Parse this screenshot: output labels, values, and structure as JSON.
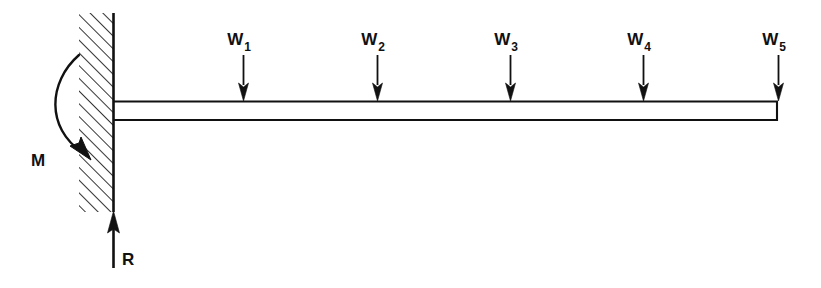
{
  "figure": {
    "type": "free-body-diagram",
    "width": 821,
    "height": 288,
    "background_color": "#ffffff",
    "line_color": "#111111"
  },
  "wall": {
    "name": "fixed-support-wall",
    "hatch_direction": "lower-left-to-upper-right",
    "x": 79,
    "y": 13,
    "width": 34,
    "height": 199,
    "face_line_x": 113
  },
  "beam": {
    "name": "cantilever-beam",
    "x_start": 113,
    "x_end": 778,
    "y_top": 101,
    "y_bottom": 120
  },
  "moment": {
    "label": "M",
    "label_x": 38,
    "label_y": 166,
    "direction": "clockwise-into-wall",
    "arc_start": [
      79,
      55
    ],
    "arc_end": [
      88,
      156
    ]
  },
  "reaction": {
    "label": "R",
    "label_x": 122,
    "label_y": 265,
    "direction": "up",
    "x": 113,
    "y_tail": 268,
    "y_tip": 212
  },
  "loads": [
    {
      "label": "W",
      "subscript": "1",
      "x": 243,
      "label_y": 45,
      "shaft_top": 55,
      "tip_y": 101,
      "direction": "down"
    },
    {
      "label": "W",
      "subscript": "2",
      "x": 377,
      "label_y": 45,
      "shaft_top": 55,
      "tip_y": 101,
      "direction": "down"
    },
    {
      "label": "W",
      "subscript": "3",
      "x": 510,
      "label_y": 45,
      "shaft_top": 55,
      "tip_y": 101,
      "direction": "down"
    },
    {
      "label": "W",
      "subscript": "4",
      "x": 643,
      "label_y": 45,
      "shaft_top": 55,
      "tip_y": 101,
      "direction": "down"
    },
    {
      "label": "W",
      "subscript": "5",
      "x": 778,
      "label_y": 45,
      "shaft_top": 55,
      "tip_y": 101,
      "direction": "down"
    }
  ]
}
